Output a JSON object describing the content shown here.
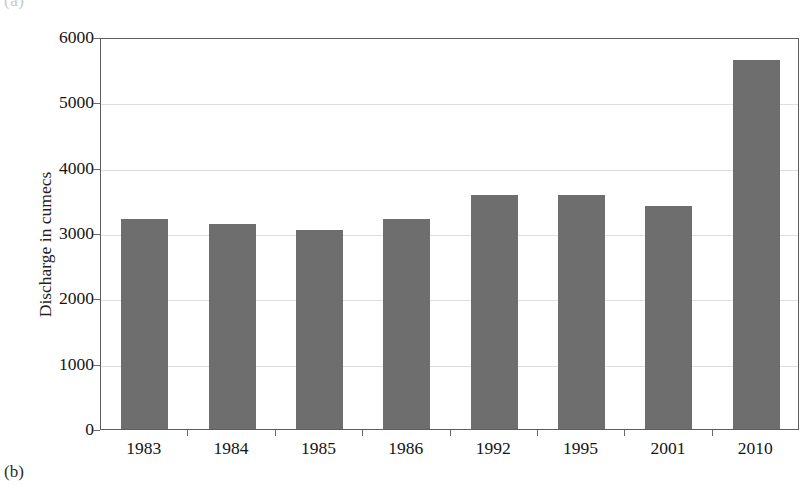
{
  "figure": {
    "panel_label": "(b)",
    "panel_label_above": "(a)"
  },
  "chart_data": {
    "type": "bar",
    "title": "",
    "xlabel": "",
    "ylabel": "Discharge in cumecs",
    "categories": [
      "1983",
      "1984",
      "1985",
      "1986",
      "1992",
      "1995",
      "2001",
      "2010"
    ],
    "values": [
      3220,
      3140,
      3050,
      3220,
      3580,
      3580,
      3410,
      5650
    ],
    "ylim": [
      0,
      6000
    ],
    "ytick_labels": [
      "6000",
      "5000",
      "4000",
      "3000",
      "2000",
      "1000",
      "0"
    ],
    "ytick_values": [
      6000,
      5000,
      4000,
      3000,
      2000,
      1000,
      0
    ],
    "grid": true,
    "grid_axis": "y",
    "legend": null,
    "series": [
      {
        "name": "Discharge in cumecs",
        "color": "#6e6e6e",
        "values": [
          3220,
          3140,
          3050,
          3220,
          3580,
          3580,
          3410,
          5650
        ]
      }
    ],
    "colors": {
      "bar": "#6e6e6e",
      "gridline": "#dedede",
      "axis": "#5d5d5d",
      "background": "#ffffff",
      "text": "#141414"
    }
  }
}
